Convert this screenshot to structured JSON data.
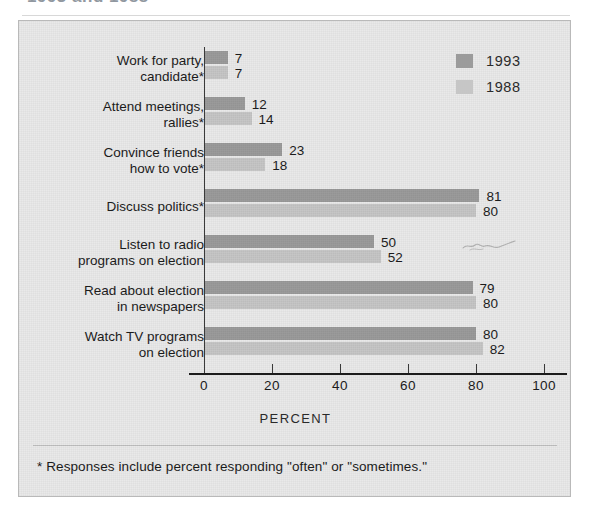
{
  "title": "1993 and 1988",
  "legend": {
    "position": "top-right",
    "entries": [
      {
        "label": "1993",
        "color": "#9b9b9b"
      },
      {
        "label": "1988",
        "color": "#c6c6c6"
      }
    ]
  },
  "axis": {
    "xlabel": "PERCENT",
    "ticks": [
      "0",
      "20",
      "40",
      "60",
      "80",
      "100"
    ]
  },
  "footnote": "* Responses include percent responding \"often\" or \"sometimes.\"",
  "chart_data": {
    "type": "bar",
    "orientation": "horizontal",
    "title": "1993 and 1988",
    "xlabel": "PERCENT",
    "ylabel": "",
    "xlim": [
      0,
      100
    ],
    "grid": false,
    "legend_position": "top-right",
    "categories": [
      "Work for party,\ncandidate*",
      "Attend meetings,\nrallies*",
      "Convince friends\nhow to vote*",
      "Discuss politics*",
      "Listen to radio\nprograms on election",
      "Read about election\nin newspapers",
      "Watch TV programs\non election"
    ],
    "series": [
      {
        "name": "1993",
        "color": "#9b9b9b",
        "values": [
          7,
          12,
          23,
          81,
          50,
          79,
          80
        ]
      },
      {
        "name": "1988",
        "color": "#c6c6c6",
        "values": [
          7,
          14,
          18,
          80,
          52,
          80,
          82
        ]
      }
    ],
    "annotations": [
      "* Responses include percent responding \"often\" or \"sometimes.\""
    ]
  }
}
